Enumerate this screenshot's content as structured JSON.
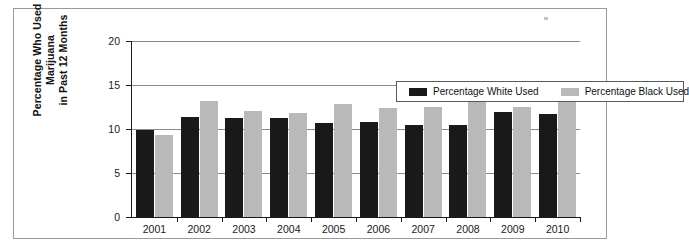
{
  "chart_data": {
    "type": "bar",
    "title": "",
    "subtitle": "",
    "xlabel": "",
    "ylabel": "Percentage Who Used Marijuana in Past 12 Months",
    "ylabel_lines": [
      "Percentage Who Used Marijuana",
      "in Past 12 Months"
    ],
    "categories": [
      "2001",
      "2002",
      "2003",
      "2004",
      "2005",
      "2006",
      "2007",
      "2008",
      "2009",
      "2010"
    ],
    "series": [
      {
        "name": "Percentage White Used",
        "color": "#191919",
        "values": [
          9.9,
          11.4,
          11.3,
          11.3,
          10.7,
          10.8,
          10.5,
          10.4,
          11.9,
          11.7
        ]
      },
      {
        "name": "Percentage Black Used",
        "color": "#b9b9b9",
        "values": [
          9.3,
          13.2,
          12.1,
          11.8,
          12.8,
          12.4,
          12.5,
          13.6,
          12.5,
          14.2
        ]
      }
    ],
    "ylim": [
      0,
      20
    ],
    "ytick_values": [
      0,
      5,
      10,
      15,
      20
    ],
    "ytick_labels": [
      "0",
      "5",
      "10",
      "15",
      "20"
    ],
    "grid": true,
    "grid_axis": "y",
    "legend_position": "top-center-inside",
    "legend_entries": [
      "Percentage White Used",
      "Percentage Black Used"
    ]
  },
  "frame": {
    "border_color": "#9a9a9a",
    "background": "#ffffff"
  },
  "axes": {
    "axis_color": "#1a1a1a",
    "gridline_color": "#8c8c8c"
  }
}
